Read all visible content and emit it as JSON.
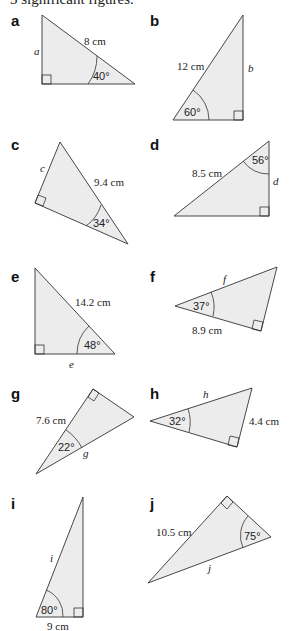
{
  "header": {
    "text": "3 significant figures."
  },
  "problems": [
    {
      "label": "a",
      "side_given": "8 cm",
      "unknown": "a",
      "angle": "40°"
    },
    {
      "label": "b",
      "side_given": "12 cm",
      "unknown": "b",
      "angle": "60°"
    },
    {
      "label": "c",
      "side_given": "9.4 cm",
      "unknown": "c",
      "angle": "34°"
    },
    {
      "label": "d",
      "side_given": "8.5 cm",
      "unknown": "d",
      "angle": "56°"
    },
    {
      "label": "e",
      "side_given": "14.2 cm",
      "unknown": "e",
      "angle": "48°"
    },
    {
      "label": "f",
      "side_given": "8.9 cm",
      "unknown": "f",
      "angle": "37°"
    },
    {
      "label": "g",
      "side_given": "7.6 cm",
      "unknown": "g",
      "angle": "22°"
    },
    {
      "label": "h",
      "side_given": "4.4 cm",
      "unknown": "h",
      "angle": "32°"
    },
    {
      "label": "i",
      "side_given": "9 cm",
      "unknown": "i",
      "angle": "80°"
    },
    {
      "label": "j",
      "side_given": "10.5 cm",
      "unknown": "j",
      "angle": "75°"
    }
  ]
}
